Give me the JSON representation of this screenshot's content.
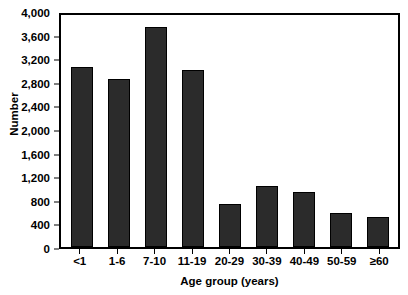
{
  "chart_data": {
    "type": "bar",
    "title": "",
    "subtitle": "",
    "xlabel": "Age group (years)",
    "ylabel": "Number",
    "categories": [
      "<1",
      "1-6",
      "7-10",
      "11-19",
      "20-29",
      "30-39",
      "40-49",
      "50-59",
      "≥60"
    ],
    "values": [
      3100,
      2900,
      3800,
      3050,
      750,
      1050,
      950,
      580,
      510
    ],
    "ylim": [
      0,
      4000
    ],
    "ytick_values": [
      0,
      400,
      800,
      1200,
      1600,
      2000,
      2400,
      2800,
      3200,
      3600,
      4000
    ],
    "ytick_labels": [
      "0",
      "400",
      "800",
      "1,200",
      "1,600",
      "2,000",
      "2,400",
      "2,800",
      "3,200",
      "3,600",
      "4,000"
    ],
    "grid": false,
    "legend": null,
    "bar_color": "#2b2b2b",
    "bar_edge_color": "#000000",
    "axis_color": "#000000",
    "background_color": "#ffffff"
  }
}
